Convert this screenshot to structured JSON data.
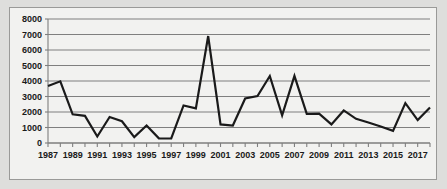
{
  "chart_data": {
    "type": "line",
    "title": "",
    "subtitle": "",
    "xlabel": "",
    "ylabel": "",
    "grid": true,
    "legend": false,
    "legend_position": "none",
    "ylim": [
      0,
      8000
    ],
    "ytick_step": 1000,
    "ytick_labels": [
      "0",
      "1000",
      "2000",
      "3000",
      "4000",
      "5000",
      "6000",
      "7000",
      "8000"
    ],
    "ytick_values": [
      0,
      1000,
      2000,
      3000,
      4000,
      5000,
      6000,
      7000,
      8000
    ],
    "xlim": [
      1987,
      2018
    ],
    "xtick_labels": [
      "1987",
      "1989",
      "1991",
      "1993",
      "1995",
      "1997",
      "1999",
      "2001",
      "2003",
      "2005",
      "2007",
      "2009",
      "2011",
      "2013",
      "2015",
      "2017"
    ],
    "x": [
      1987,
      1988,
      1989,
      1990,
      1991,
      1992,
      1993,
      1994,
      1995,
      1996,
      1997,
      1998,
      1999,
      2000,
      2001,
      2002,
      2003,
      2004,
      2005,
      2006,
      2007,
      2008,
      2009,
      2010,
      2011,
      2012,
      2013,
      2014,
      2015,
      2016,
      2017,
      2018
    ],
    "values": [
      3680,
      3980,
      1850,
      1750,
      420,
      1680,
      1400,
      380,
      1130,
      300,
      290,
      2420,
      2230,
      6900,
      1200,
      1130,
      2870,
      3030,
      4320,
      1780,
      4330,
      1880,
      1900,
      1200,
      2100,
      1560,
      1320,
      1060,
      780,
      2570,
      1480,
      2290
    ],
    "series_name": "series-1",
    "line_color": "#1a1a1a",
    "line_width": 2.2,
    "plot_background": "#f2f2f0",
    "grid_color": "#7f7f7f",
    "axis_color": "#7f7f7f",
    "page_background": "#dededc",
    "frame_border_color": "#9a9a98"
  }
}
